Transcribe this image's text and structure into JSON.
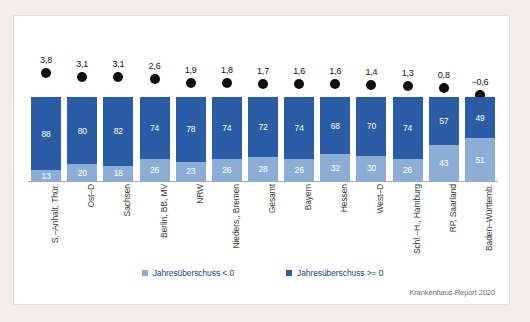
{
  "chart_data": {
    "type": "bar",
    "title": "",
    "subtitle": "",
    "xlabel": "",
    "ylabel": "",
    "ylim": [
      0,
      100
    ],
    "grid": false,
    "legend_position": "bottom",
    "stacked": true,
    "categories": [
      "S.–Anhalt, Thür.",
      "Ost–D",
      "Sachsen",
      "Berlin, BB, MV",
      "NRW",
      "Nieders., Bremen",
      "Gesamt",
      "Bayern",
      "Hessen",
      "West–D",
      "Schl.–H., Hamburg",
      "RP, Saarland",
      "Baden–Württemb."
    ],
    "series": [
      {
        "name": "Jahresüberschuss >= 0",
        "color": "#2b5ca6",
        "values": [
          88,
          80,
          82,
          74,
          78,
          74,
          72,
          74,
          68,
          70,
          74,
          57,
          49
        ]
      },
      {
        "name": "Jahresüberschuss < 0",
        "color": "#8badd6",
        "values": [
          13,
          20,
          18,
          26,
          23,
          26,
          28,
          26,
          32,
          30,
          26,
          43,
          51
        ]
      }
    ],
    "marker_series": {
      "name": "Jahresüberschuss Marker",
      "color": "#111111",
      "labels": [
        "3,8",
        "3,1",
        "3,1",
        "2,6",
        "1,9",
        "1,8",
        "1,7",
        "1,6",
        "1,6",
        "1,4",
        "1,3",
        "0,8",
        "−0,6"
      ],
      "values": [
        3.8,
        3.1,
        3.1,
        2.6,
        1.9,
        1.8,
        1.7,
        1.6,
        1.6,
        1.4,
        1.3,
        0.8,
        -0.6
      ]
    }
  },
  "legend": {
    "items": [
      {
        "label": "Jahresüberschuss < 0",
        "color": "#8badd6"
      },
      {
        "label": "Jahresüberschuss >= 0",
        "color": "#2b5ca6"
      }
    ]
  },
  "source": {
    "text": "Krankenhaus-Report 2020"
  }
}
